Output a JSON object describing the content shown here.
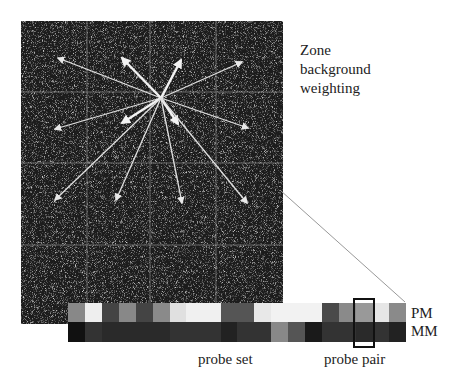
{
  "labels": {
    "zone": [
      "Zone",
      "background",
      "weighting"
    ],
    "pm": "PM",
    "mm": "MM",
    "probe_set": "probe set",
    "probe_pair": "probe pair"
  },
  "microarray": {
    "x": 21,
    "y": 21,
    "width": 262,
    "height": 303,
    "background": "#1c1c1c",
    "grid_x": [
      87,
      150,
      216
    ],
    "grid_y": [
      92,
      163,
      245
    ],
    "center": [
      161,
      98
    ],
    "arrows": [
      {
        "to": [
          58,
          58
        ],
        "thick": false
      },
      {
        "to": [
          122,
          58
        ],
        "thick": true
      },
      {
        "to": [
          181,
          60
        ],
        "thick": true
      },
      {
        "to": [
          242,
          62
        ],
        "thick": false
      },
      {
        "to": [
          55,
          129
        ],
        "thick": false
      },
      {
        "to": [
          122,
          123
        ],
        "thick": true
      },
      {
        "to": [
          178,
          124
        ],
        "thick": true
      },
      {
        "to": [
          248,
          128
        ],
        "thick": false
      },
      {
        "to": [
          55,
          200
        ],
        "thick": false
      },
      {
        "to": [
          116,
          200
        ],
        "thick": false
      },
      {
        "to": [
          182,
          203
        ],
        "thick": false
      },
      {
        "to": [
          247,
          203
        ],
        "thick": false
      }
    ]
  },
  "zoom_line": {
    "from": [
      280,
      190
    ],
    "to": [
      405,
      302
    ],
    "color": "#999999"
  },
  "probe_set": {
    "cell_widths": [
      17,
      17,
      17,
      17,
      17,
      17,
      16,
      18,
      17,
      16,
      17,
      17,
      17,
      17,
      17,
      17,
      17,
      17,
      16,
      17
    ],
    "pm_colors": [
      "#888888",
      "#eeeeee",
      "#444444",
      "#888888",
      "#444444",
      "#8a8a8a",
      "#e0e0e0",
      "#f0f0f0",
      "#f0f0f0",
      "#555555",
      "#555555",
      "#e8e8e8",
      "#f2f2f2",
      "#f2f2f2",
      "#f2f2f2",
      "#4a4a4a",
      "#8a8a8a",
      "#999999",
      "#e6e6e6",
      "#8a8a8a"
    ],
    "mm_colors": [
      "#111111",
      "#333333",
      "#2a2a2a",
      "#2a2a2a",
      "#2a2a2a",
      "#2a2a2a",
      "#333333",
      "#333333",
      "#333333",
      "#222222",
      "#333333",
      "#333333",
      "#888888",
      "#555555",
      "#1a1a1a",
      "#333333",
      "#333333",
      "#2a2a2a",
      "#333333",
      "#222222"
    ],
    "highlighted_pair_index": 17
  }
}
